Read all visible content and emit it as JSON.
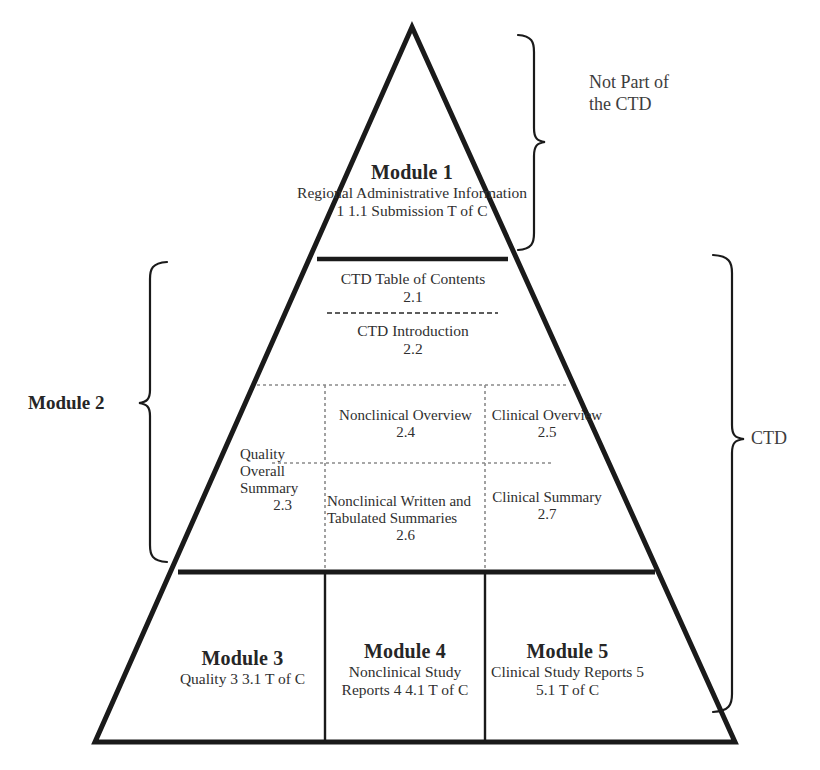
{
  "diagram": {
    "type": "pyramid",
    "line_color": "#1a1a1a",
    "dotted_color": "#7a7a7a",
    "text_color": "#3a3a3a"
  },
  "module1": {
    "title": "Module 1",
    "lines": "Regional\nAdministrative\nInformation\n1\n1.1 Submission\nT of C"
  },
  "module2": {
    "toc": {
      "label": "CTD Table of Contents",
      "number": "2.1"
    },
    "intro": {
      "label": "CTD Introduction",
      "number": "2.2"
    },
    "quality_overall_summary": {
      "label": "Quality\nOverall\nSummary",
      "number": "2.3"
    },
    "nonclinical_overview": {
      "label": "Nonclinical\nOverview",
      "number": "2.4"
    },
    "clinical_overview": {
      "label": "Clinical\nOverview",
      "number": "2.5"
    },
    "nonclinical_summaries": {
      "label": "Nonclinical\nWritten and\nTabulated\nSummaries",
      "number": "2.6"
    },
    "clinical_summary": {
      "label": "Clinical\nSummary",
      "number": "2.7"
    }
  },
  "module3": {
    "title": "Module 3",
    "lines": "Quality\n3\n3.1 T of C"
  },
  "module4": {
    "title": "Module 4",
    "lines": "Nonclinical\nStudy Reports\n4\n4.1 T of C"
  },
  "module5": {
    "title": "Module 5",
    "lines": "Clinical\nStudy Reports\n5\n5.1 T of C"
  },
  "annotations": {
    "not_part_of_ctd": "Not Part of\nthe CTD",
    "module2_label": "Module 2",
    "ctd_label": "CTD"
  }
}
